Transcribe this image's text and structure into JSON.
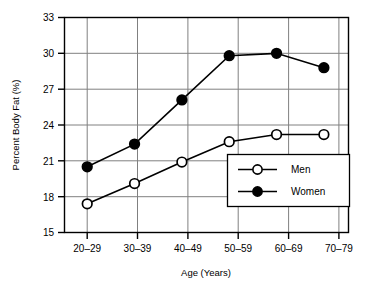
{
  "chart_data": {
    "type": "line",
    "title": "",
    "xlabel": "Age (Years)",
    "ylabel": "Percent Body Fat (%)",
    "categories": [
      "20–29",
      "30–39",
      "40–49",
      "50–59",
      "60–69",
      "70–79"
    ],
    "ylim": [
      15,
      33
    ],
    "yticks": [
      15,
      18,
      21,
      24,
      27,
      30,
      33
    ],
    "ytick_labels": [
      "15",
      "18",
      "21",
      "24",
      "27",
      "30",
      "33"
    ],
    "grid": true,
    "legend_position": "inside-right-lower",
    "series": [
      {
        "name": "Men",
        "marker": "open-circle",
        "color": "#000000",
        "values": [
          17.4,
          19.1,
          20.9,
          22.6,
          23.2,
          23.2
        ]
      },
      {
        "name": "Women",
        "marker": "filled-circle",
        "color": "#000000",
        "values": [
          20.5,
          22.4,
          26.1,
          29.8,
          30.0,
          28.8
        ]
      }
    ],
    "legend": [
      {
        "label": "Men",
        "marker": "open-circle"
      },
      {
        "label": "Women",
        "marker": "filled-circle"
      }
    ]
  },
  "colors": {
    "axis": "#000000",
    "grid": "#808080",
    "marker_fill_open": "#ffffff",
    "marker_fill_closed": "#000000",
    "background": "#ffffff"
  }
}
